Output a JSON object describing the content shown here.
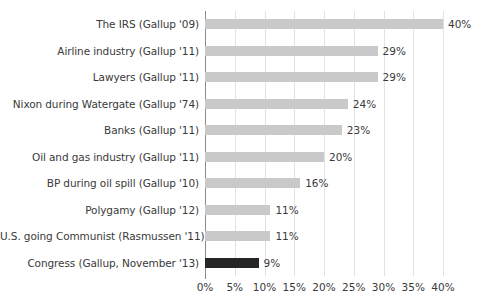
{
  "chart_data": {
    "type": "bar",
    "orientation": "horizontal",
    "title": "",
    "subtitle": "",
    "xlabel": "",
    "ylabel": "",
    "xlim": [
      0,
      40
    ],
    "grid": true,
    "legend": false,
    "value_suffix": "%",
    "xticks": [
      "0%",
      "5%",
      "10%",
      "15%",
      "20%",
      "25%",
      "30%",
      "35%",
      "40%"
    ],
    "xtick_values": [
      0,
      5,
      10,
      15,
      20,
      25,
      30,
      35,
      40
    ],
    "categories": [
      "The IRS (Gallup '09)",
      "Airline industry (Gallup '11)",
      "Lawyers (Gallup '11)",
      "Nixon during Watergate (Gallup '74)",
      "Banks (Gallup '11)",
      "Oil and gas industry (Gallup '11)",
      "BP during oil spill (Gallup '10)",
      "Polygamy (Gallup '12)",
      "U.S. going Communist (Rasmussen '11)",
      "Congress (Gallup, November '13)"
    ],
    "values": [
      40,
      29,
      29,
      24,
      23,
      20,
      16,
      11,
      11,
      9
    ],
    "value_labels": [
      "40%",
      "29%",
      "29%",
      "24%",
      "23%",
      "20%",
      "16%",
      "11%",
      "11%",
      "9%"
    ],
    "highlight_index": 9,
    "colors": {
      "bar": "#c9c9c9",
      "bar_highlight": "#262626",
      "gridline": "#e2e2e2",
      "axis": "#8a8a8a",
      "text": "#3a3a3a",
      "background": "#ffffff"
    }
  }
}
